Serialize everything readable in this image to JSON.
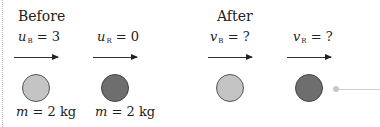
{
  "diagram": {
    "title_before": "Before",
    "title_after": "After",
    "before": {
      "ball_B": {
        "var": "u",
        "sub": "B",
        "eq": " = 3",
        "mass_var": "m",
        "mass_eq": " = 2 kg",
        "color": "#c4c4c4"
      },
      "ball_R": {
        "var": "u",
        "sub": "R",
        "eq": " = 0",
        "mass_var": "m",
        "mass_eq": " = 2 kg",
        "color": "#6e6e6e"
      }
    },
    "after": {
      "ball_B": {
        "var": "v",
        "sub": "B",
        "eq": " = ?",
        "color": "#c4c4c4"
      },
      "ball_R": {
        "var": "v",
        "sub": "R",
        "eq": " = ?",
        "color": "#6e6e6e"
      }
    }
  }
}
